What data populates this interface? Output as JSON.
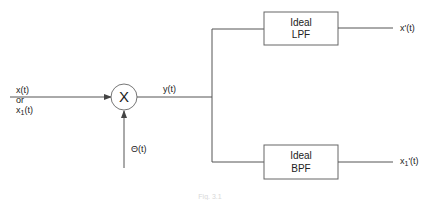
{
  "diagram": {
    "type": "block-diagram",
    "inputs": {
      "signal_label_1": "x(t)",
      "or_label": "or",
      "signal_label_2_base": "x",
      "signal_label_2_sub": "1",
      "signal_label_2_tail": "(t)",
      "carrier_label": "Θ(t)"
    },
    "multiplier": {
      "symbol": "X"
    },
    "mixer_output_label": "y(t)",
    "filters": [
      {
        "line1": "Ideal",
        "line2": "LPF",
        "output_label": "x'(t)"
      },
      {
        "line1": "Ideal",
        "line2": "BPF",
        "output_base": "x",
        "output_sub": "1",
        "output_tail": "'(t)"
      }
    ],
    "caption": "Fig. 3.1"
  },
  "colors": {
    "line": "#555555",
    "box_border": "#666666",
    "text": "#222222"
  }
}
